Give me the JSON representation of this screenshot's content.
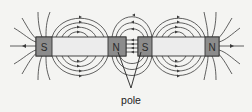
{
  "diagram": {
    "magnets": [
      {
        "id": "magnet-1",
        "left_pole": "S",
        "right_pole": "N"
      },
      {
        "id": "magnet-2",
        "left_pole": "S",
        "right_pole": "N"
      }
    ],
    "label": "pole",
    "colors": {
      "background": "#f4f4f2",
      "bar_body": "#ececec",
      "pole_block": "#8c8c8c",
      "field_line": "#3a3a3a"
    }
  }
}
